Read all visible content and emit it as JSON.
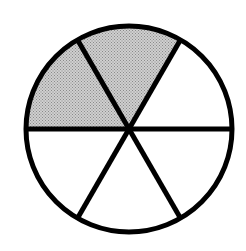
{
  "diagram": {
    "type": "fraction-circle",
    "total_parts": 6,
    "shaded_parts": 2,
    "fraction": "2/6",
    "shade_color": "#b8b8b8",
    "line_color": "#000000",
    "background": "#ffffff",
    "center": [
      129,
      129
    ],
    "radius": 103,
    "sectors": [
      {
        "from_deg": 0,
        "to_deg": 60,
        "shaded": false
      },
      {
        "from_deg": 60,
        "to_deg": 120,
        "shaded": true
      },
      {
        "from_deg": 120,
        "to_deg": 180,
        "shaded": true
      },
      {
        "from_deg": 180,
        "to_deg": 240,
        "shaded": false
      },
      {
        "from_deg": 240,
        "to_deg": 300,
        "shaded": false
      },
      {
        "from_deg": 300,
        "to_deg": 360,
        "shaded": false
      }
    ]
  }
}
